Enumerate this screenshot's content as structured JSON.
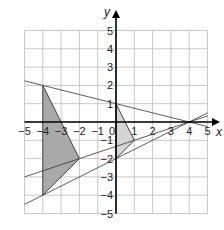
{
  "axes": {
    "x_label": "x",
    "y_label": "y",
    "x_range": [
      -5,
      5
    ],
    "y_range": [
      -5,
      5
    ]
  },
  "x_ticks": [
    "-5",
    "-4",
    "-3",
    "-2",
    "-1",
    "0",
    "1",
    "2",
    "3",
    "4",
    "5"
  ],
  "y_ticks": [
    "5",
    "4",
    "3",
    "2",
    "1",
    "-1",
    "-2",
    "-3",
    "-4",
    "-5"
  ],
  "shapes": [
    {
      "name": "triangle-dark",
      "points": [
        [
          -4,
          2
        ],
        [
          -2,
          -2
        ],
        [
          -4,
          -4
        ]
      ],
      "fill": "#a9a9a9"
    },
    {
      "name": "triangle-light",
      "points": [
        [
          0,
          1
        ],
        [
          1,
          -1
        ],
        [
          0,
          -2
        ]
      ],
      "fill": "#d4d4d4"
    }
  ],
  "lines": [
    {
      "name": "line-a",
      "from": [
        -5,
        2.25
      ],
      "to": [
        5,
        -0.25
      ]
    },
    {
      "name": "line-b",
      "from": [
        -5,
        -3
      ],
      "to": [
        5,
        0.333
      ]
    },
    {
      "name": "line-c",
      "from": [
        -5,
        -4.5
      ],
      "to": [
        5,
        0.5
      ]
    }
  ]
}
